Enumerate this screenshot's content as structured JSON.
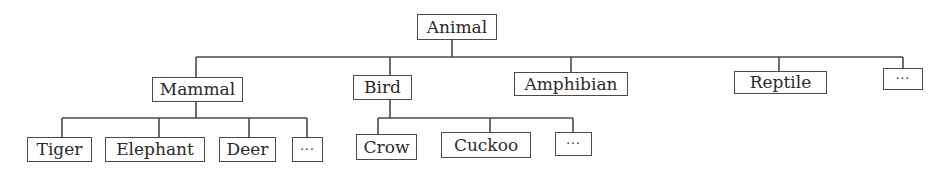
{
  "diagram": {
    "type": "tree",
    "root": {
      "label": "Animal",
      "children": [
        {
          "label": "Mammal",
          "children": [
            {
              "label": "Tiger"
            },
            {
              "label": "Elephant"
            },
            {
              "label": "Deer"
            },
            {
              "label": "···"
            }
          ]
        },
        {
          "label": "Bird",
          "children": [
            {
              "label": "Crow"
            },
            {
              "label": "Cuckoo"
            },
            {
              "label": "···"
            }
          ]
        },
        {
          "label": "Amphibian"
        },
        {
          "label": "Reptile"
        },
        {
          "label": "···"
        }
      ]
    }
  },
  "nodes": {
    "animal": "Animal",
    "mammal": "Mammal",
    "bird": "Bird",
    "amphibian": "Amphibian",
    "reptile": "Reptile",
    "more_classes": "···",
    "tiger": "Tiger",
    "elephant": "Elephant",
    "deer": "Deer",
    "more_mammals": "···",
    "crow": "Crow",
    "cuckoo": "Cuckoo",
    "more_birds": "···"
  },
  "colors": {
    "line": "#4a4a4a",
    "text": "#2a2a2a",
    "background": "#ffffff"
  }
}
